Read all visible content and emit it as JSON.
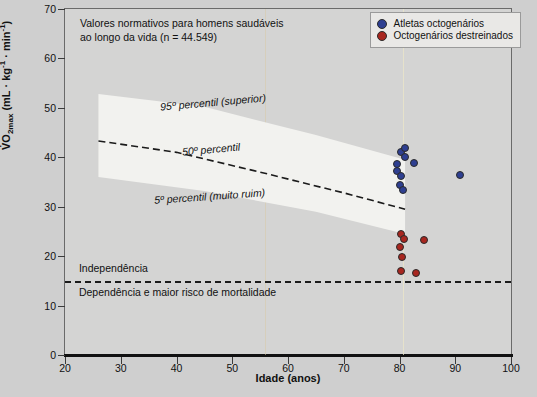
{
  "chart_data": {
    "type": "scatter",
    "title": "Valores normativos para homens saudáveis ao longo da vida (n = 44.549)",
    "title_lines": [
      "Valores normativos para homens saudáveis",
      "ao longo da vida (n = 44.549)"
    ],
    "xlabel": "Idade (anos)",
    "ylabel_html": "V̇O2max (mL · kg-1 · min-1)",
    "ylabel_parts": {
      "main": "VO",
      "sub": "2max",
      "units_pre": " (mL · kg",
      "sup1": "-1",
      "mid": " · min",
      "sup2": "-1",
      "units_post": ")"
    },
    "xlim": [
      20,
      100
    ],
    "ylim": [
      0,
      70
    ],
    "xticks": [
      20,
      30,
      40,
      50,
      60,
      70,
      80,
      90,
      100
    ],
    "yticks": [
      0,
      10,
      20,
      30,
      40,
      50,
      60,
      70
    ],
    "grid": false,
    "legend_position": "top-right",
    "legend": [
      {
        "label": "Atletas octogenários",
        "color": "#2e3f91"
      },
      {
        "label": "Octogenários destreinados",
        "color": "#a8261f"
      }
    ],
    "annotations": [
      {
        "text": "95º percentil (superior)",
        "x": 37,
        "y": 51
      },
      {
        "text": "50º percentil",
        "x": 41,
        "y": 41.5
      },
      {
        "text": "5º percentil (muito ruim)",
        "x": 36,
        "y": 32
      },
      {
        "text": "Independência",
        "x": 22.5,
        "y": 17.5
      },
      {
        "text": "Dependência e maior risco de mortalidade",
        "x": 22.5,
        "y": 12.5
      }
    ],
    "reference_lines": [
      {
        "name": "independence-threshold",
        "y": 15,
        "style": "dashed",
        "color": "#1b1b1b"
      },
      {
        "name": "50th-percentile",
        "style": "dashed",
        "color": "#1b1b1b",
        "points": [
          [
            26,
            43.3
          ],
          [
            40,
            41.0
          ],
          [
            55,
            37.0
          ],
          [
            70,
            32.8
          ],
          [
            81,
            29.5
          ]
        ]
      }
    ],
    "band": {
      "name": "normative-percentile-band",
      "fill": "#f2f2ef",
      "top_points": [
        [
          26,
          52.8
        ],
        [
          45,
          50.2
        ],
        [
          65,
          44.5
        ],
        [
          81,
          39.5
        ]
      ],
      "bottom_points": [
        [
          26,
          36.0
        ],
        [
          45,
          33.2
        ],
        [
          65,
          29.0
        ],
        [
          81,
          24.5
        ]
      ]
    },
    "series": [
      {
        "name": "Atletas octogenários",
        "color": "#2e3f91",
        "points": [
          {
            "x": 79.6,
            "y": 38.6
          },
          {
            "x": 80.3,
            "y": 41.0
          },
          {
            "x": 80.9,
            "y": 41.9
          },
          {
            "x": 81.0,
            "y": 40.1
          },
          {
            "x": 79.5,
            "y": 37.3
          },
          {
            "x": 80.2,
            "y": 36.3
          },
          {
            "x": 82.6,
            "y": 38.8
          },
          {
            "x": 80.0,
            "y": 34.3
          },
          {
            "x": 80.6,
            "y": 33.3
          },
          {
            "x": 90.8,
            "y": 36.4
          }
        ]
      },
      {
        "name": "Octogenários destreinados",
        "color": "#a8261f",
        "points": [
          {
            "x": 80.2,
            "y": 24.4
          },
          {
            "x": 80.8,
            "y": 23.4
          },
          {
            "x": 84.4,
            "y": 23.2
          },
          {
            "x": 80.1,
            "y": 21.9
          },
          {
            "x": 80.5,
            "y": 19.8
          },
          {
            "x": 80.2,
            "y": 17.0
          },
          {
            "x": 83.0,
            "y": 16.6
          }
        ]
      }
    ]
  }
}
